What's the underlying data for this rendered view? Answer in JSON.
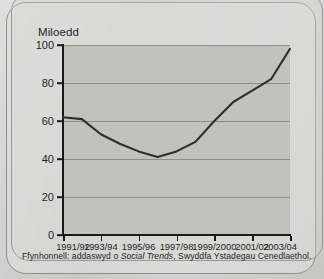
{
  "figure": {
    "ylabel": "Miloedd",
    "footnote_prefix": "Ffynhonnell: addaswyd o ",
    "footnote_source": "Social Trends",
    "footnote_suffix": ", Swyddfa Ystadegau Cenedlaethol.",
    "line_color": "#2b2b2b",
    "plot_background": "#c2c2bd",
    "grid_color": "#8d8d88",
    "axis_color": "#171717"
  },
  "chart_data": {
    "type": "line",
    "title": "",
    "subtitle": "",
    "xlabel": "",
    "ylabel": "Miloedd",
    "ylim": [
      0,
      100
    ],
    "yticks": [
      0,
      20,
      40,
      60,
      80,
      100
    ],
    "ytick_labels": [
      "0",
      "20",
      "40",
      "60",
      "80",
      "100"
    ],
    "grid": true,
    "legend": "none",
    "categories": [
      "1991/92",
      "1992/93",
      "1993/94",
      "1994/95",
      "1995/96",
      "1996/97",
      "1997/98",
      "1998/99",
      "1999/2000",
      "2000/01",
      "2001/02",
      "2002/03",
      "2003/04"
    ],
    "xtick_labels": [
      "1991/92",
      "1993/94",
      "1995/96",
      "1997/98",
      "1999/2000",
      "2001/02",
      "2003/04"
    ],
    "xtick_indices": [
      0,
      2,
      4,
      6,
      8,
      10,
      12
    ],
    "series": [
      {
        "name": "Miloedd",
        "values": [
          62,
          61,
          53,
          48,
          44,
          41,
          44,
          49,
          60,
          70,
          76,
          82,
          98
        ]
      }
    ]
  }
}
